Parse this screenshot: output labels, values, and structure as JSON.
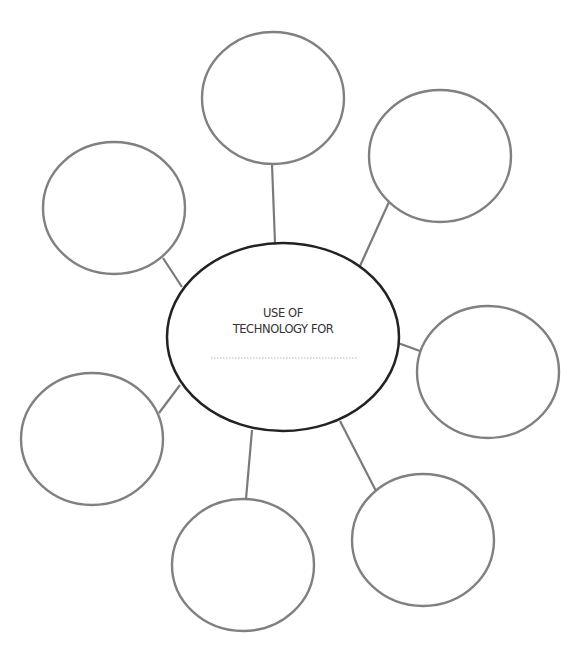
{
  "diagram": {
    "type": "bubble-map",
    "center": {
      "line1": "USE OF",
      "line2": "TECHNOLOGY FOR",
      "blank": "",
      "cx": 283,
      "cy": 337,
      "rx": 116,
      "ry": 94,
      "stroke": "#222222"
    },
    "bubble_stroke": "#808080",
    "connector_stroke": "#7a7a7a",
    "bubbles": [
      {
        "id": "top",
        "text": "",
        "cx": 273,
        "cy": 98,
        "rx": 71,
        "ry": 66,
        "line": [
          272,
          164,
          275,
          243
        ]
      },
      {
        "id": "top-right",
        "text": "",
        "cx": 440,
        "cy": 156,
        "rx": 71,
        "ry": 66,
        "line": [
          389,
          202,
          360,
          266
        ]
      },
      {
        "id": "top-left",
        "text": "",
        "cx": 114,
        "cy": 208,
        "rx": 71,
        "ry": 66,
        "line": [
          163,
          258,
          182,
          287
        ]
      },
      {
        "id": "right",
        "text": "",
        "cx": 488,
        "cy": 372,
        "rx": 71,
        "ry": 66,
        "line": [
          398,
          343,
          420,
          351
        ]
      },
      {
        "id": "left",
        "text": "",
        "cx": 92,
        "cy": 439,
        "rx": 71,
        "ry": 66,
        "line": [
          159,
          413,
          180,
          385
        ]
      },
      {
        "id": "bottom-left",
        "text": "",
        "cx": 243,
        "cy": 565,
        "rx": 71,
        "ry": 66,
        "line": [
          252,
          430,
          246,
          499
        ]
      },
      {
        "id": "bottom-right",
        "text": "",
        "cx": 423,
        "cy": 540,
        "rx": 71,
        "ry": 66,
        "line": [
          340,
          421,
          376,
          491
        ]
      }
    ]
  }
}
